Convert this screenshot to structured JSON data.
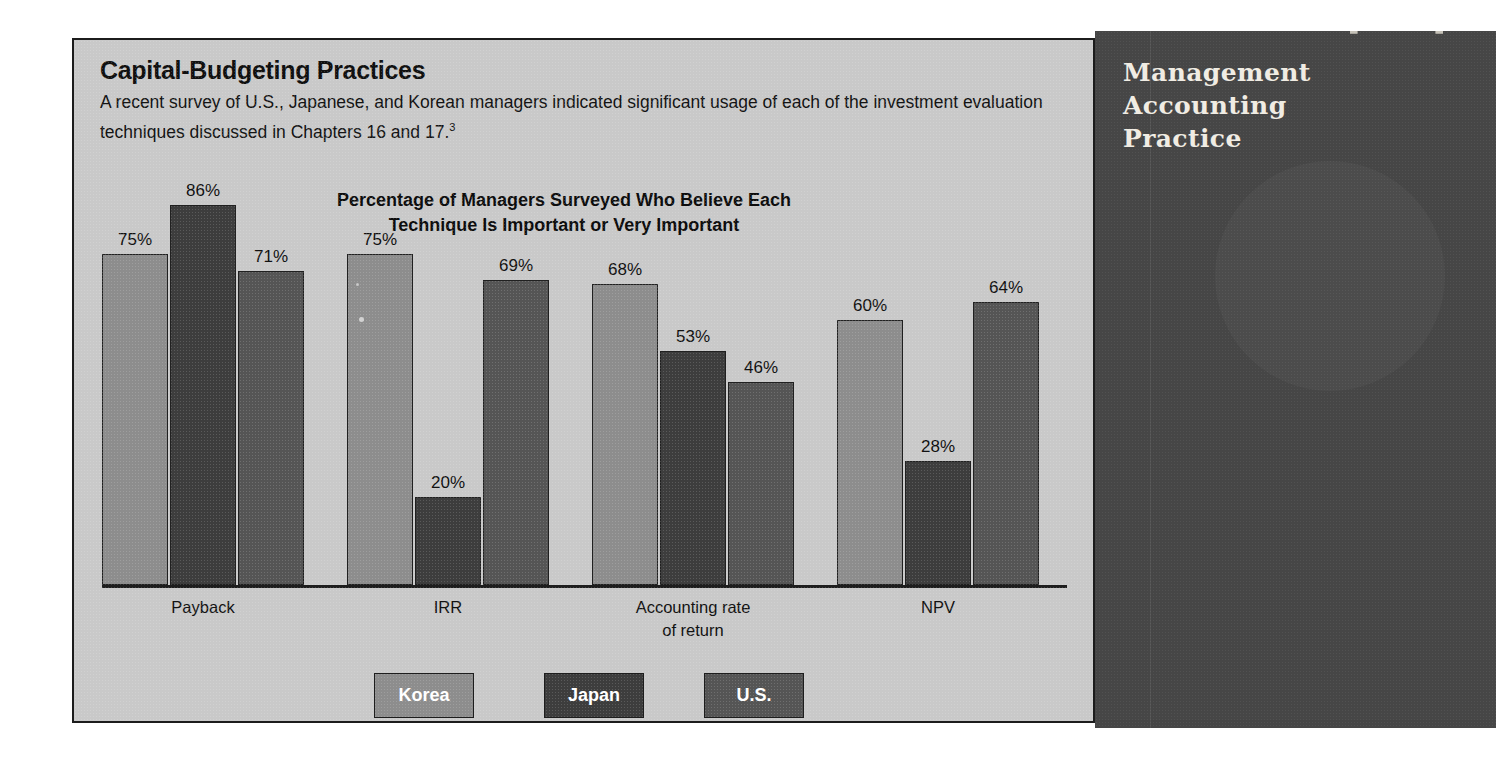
{
  "header": {
    "title": "Capital-Budgeting Practices",
    "body_line1": "A recent survey of U.S., Japanese, and Korean managers indicated significant usage of each of the investment",
    "body_line2": "evaluation techniques discussed in Chapters 16 and 17.",
    "footnote_marker": "3"
  },
  "sidebar": {
    "line1": "Management",
    "line2": "Accounting",
    "line3": "Practice",
    "vertical_label": "M.A.P."
  },
  "legend": {
    "items": [
      {
        "label": "Korea",
        "color": "#8d8d8d"
      },
      {
        "label": "Japan",
        "color": "#3d3d3d"
      },
      {
        "label": "U.S.",
        "color": "#555555"
      }
    ]
  },
  "chart_data": {
    "type": "bar",
    "title": "Percentage of Managers Surveyed Who Believe Each Technique Is Important or Very Important",
    "title_line1": "Percentage of Managers Surveyed Who Believe Each",
    "title_line2": "Technique Is Important or Very Important",
    "xlabel": "",
    "ylabel": "",
    "ylim": [
      0,
      100
    ],
    "grid": false,
    "legend_position": "bottom",
    "categories": [
      "Payback",
      "IRR",
      "Accounting rate of return",
      "NPV"
    ],
    "category_labels": [
      {
        "line1": "Payback",
        "line2": ""
      },
      {
        "line1": "IRR",
        "line2": ""
      },
      {
        "line1": "Accounting rate",
        "line2": "of return"
      },
      {
        "line1": "NPV",
        "line2": ""
      }
    ],
    "series": [
      {
        "name": "Korea",
        "color": "#8d8d8d",
        "values": [
          75,
          75,
          68,
          60
        ],
        "labels": [
          "75%",
          "75%",
          "68%",
          "60%"
        ]
      },
      {
        "name": "Japan",
        "color": "#3d3d3d",
        "values": [
          86,
          20,
          53,
          28
        ],
        "labels": [
          "86%",
          "20%",
          "53%",
          "28%"
        ]
      },
      {
        "name": "U.S.",
        "color": "#555555",
        "values": [
          71,
          69,
          46,
          64
        ],
        "labels": [
          "71%",
          "69%",
          "46%",
          "64%"
        ]
      }
    ]
  }
}
